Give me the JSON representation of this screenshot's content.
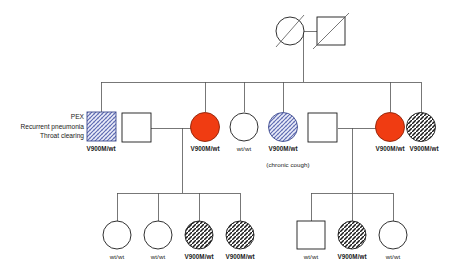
{
  "figure": {
    "kind": "pedigree-chart",
    "background": "#ffffff",
    "line_color": "#4a4a4a",
    "symbol_stroke": "#1a1a1a",
    "colors": {
      "affected_red": "#f03c12",
      "hatch_blue": "#5b68b0",
      "hatch_blue_fill": "#e3e6f4",
      "hatch_black": "#1a1a1a",
      "unaffected_white": "#ffffff"
    }
  },
  "annotations": {
    "proband_notes": [
      "PEX",
      "Recurrent pneumonia",
      "Throat clearing"
    ],
    "chronic_cough": "(chronic cough)"
  },
  "generations": [
    {
      "id": "I",
      "members": [
        {
          "id": "I-1",
          "sex": "female",
          "shape": "circle",
          "fill": "white",
          "deceased": true,
          "genotype": ""
        },
        {
          "id": "I-2",
          "sex": "male",
          "shape": "square",
          "fill": "white",
          "deceased": true,
          "genotype": ""
        }
      ]
    },
    {
      "id": "II",
      "members": [
        {
          "id": "II-1",
          "sex": "male",
          "shape": "square",
          "fill": "hatch-blue",
          "deceased": false,
          "genotype": "V900M/wt",
          "proband": true
        },
        {
          "id": "II-2",
          "sex": "male",
          "shape": "square",
          "fill": "white",
          "deceased": false,
          "genotype": ""
        },
        {
          "id": "II-3",
          "sex": "female",
          "shape": "circle",
          "fill": "red",
          "deceased": false,
          "genotype": "V900M/wt"
        },
        {
          "id": "II-4",
          "sex": "female",
          "shape": "circle",
          "fill": "white",
          "deceased": false,
          "genotype": "wt/wt"
        },
        {
          "id": "II-5",
          "sex": "female",
          "shape": "circle",
          "fill": "hatch-blue",
          "deceased": false,
          "genotype": "V900M/wt",
          "note": "(chronic cough)"
        },
        {
          "id": "II-6",
          "sex": "male",
          "shape": "square",
          "fill": "white",
          "deceased": false,
          "genotype": ""
        },
        {
          "id": "II-7",
          "sex": "female",
          "shape": "circle",
          "fill": "red",
          "deceased": false,
          "genotype": "V900M/wt"
        },
        {
          "id": "II-8",
          "sex": "female",
          "shape": "circle",
          "fill": "hatch-black",
          "deceased": false,
          "genotype": "V900M/wt"
        }
      ]
    },
    {
      "id": "III",
      "members": [
        {
          "id": "III-1",
          "sex": "female",
          "shape": "circle",
          "fill": "white",
          "deceased": false,
          "genotype": "wt/wt"
        },
        {
          "id": "III-2",
          "sex": "female",
          "shape": "circle",
          "fill": "white",
          "deceased": false,
          "genotype": "wt/wt"
        },
        {
          "id": "III-3",
          "sex": "female",
          "shape": "circle",
          "fill": "hatch-black",
          "deceased": false,
          "genotype": "V900M/wt"
        },
        {
          "id": "III-4",
          "sex": "female",
          "shape": "circle",
          "fill": "hatch-black",
          "deceased": false,
          "genotype": "V900M/wt"
        },
        {
          "id": "III-5",
          "sex": "male",
          "shape": "square",
          "fill": "white",
          "deceased": false,
          "genotype": "wt/wt"
        },
        {
          "id": "III-6",
          "sex": "female",
          "shape": "circle",
          "fill": "hatch-black",
          "deceased": false,
          "genotype": "V900M/wt"
        },
        {
          "id": "III-7",
          "sex": "female",
          "shape": "circle",
          "fill": "white",
          "deceased": false,
          "genotype": "wt/wt"
        }
      ]
    }
  ],
  "labels": {
    "anno_1": "PEX",
    "anno_2": "Recurrent pneumonia",
    "anno_3": "Throat clearing",
    "g2_1": "V900M/wt",
    "g2_3": "V900M/wt",
    "g2_4": "wt/wt",
    "g2_5": "V900M/wt",
    "g2_5_note": "(chronic cough)",
    "g2_7": "V900M/wt",
    "g2_8": "V900M/wt",
    "g3_1": "wt/wt",
    "g3_2": "wt/wt",
    "g3_3": "V900M/wt",
    "g3_4": "V900M/wt",
    "g3_5": "wt/wt",
    "g3_6": "V900M/wt",
    "g3_7": "wt/wt"
  }
}
